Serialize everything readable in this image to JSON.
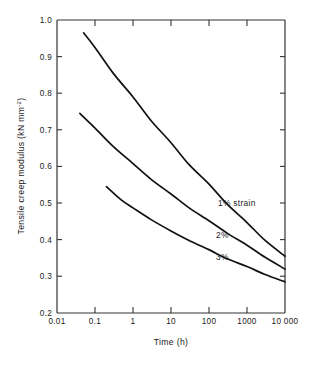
{
  "chart_data": {
    "type": "line",
    "title": "",
    "xlabel": "Time (h)",
    "ylabel": "Tensile creep modulus (kN mm⁻²)",
    "ylabel_parts": {
      "main": "Tensile creep modulus (kN mm",
      "exponent": "-2",
      "tail": ")"
    },
    "xscale": "log",
    "yscale": "linear",
    "xlim": [
      0.01,
      10000
    ],
    "ylim": [
      0.2,
      1.0
    ],
    "grid": false,
    "legend_position": "inline-annotations",
    "xticks": [
      0.01,
      0.1,
      1,
      10,
      100,
      1000,
      10000
    ],
    "xticklabels": [
      "0.01",
      "0.1",
      "1",
      "10",
      "100",
      "1000",
      "10 000"
    ],
    "yticks": [
      0.2,
      0.3,
      0.4,
      0.5,
      0.6,
      0.7,
      0.8,
      0.9,
      1.0
    ],
    "yticklabels": [
      "0.2",
      "0.3",
      "0.4",
      "0.5",
      "0.6",
      "0.7",
      "0.8",
      "0.9",
      "1.0"
    ],
    "series": [
      {
        "name": "1% strain",
        "label": "1% strain",
        "x": [
          0.05,
          0.1,
          0.3,
          1,
          3,
          10,
          30,
          100,
          300,
          1000,
          3000,
          10000
        ],
        "values": [
          0.965,
          0.925,
          0.855,
          0.79,
          0.725,
          0.665,
          0.605,
          0.552,
          0.497,
          0.447,
          0.398,
          0.355
        ]
      },
      {
        "name": "2%",
        "label": "2%",
        "x": [
          0.04,
          0.1,
          0.3,
          1,
          3,
          10,
          30,
          100,
          300,
          1000,
          3000,
          10000
        ],
        "values": [
          0.745,
          0.705,
          0.655,
          0.608,
          0.565,
          0.525,
          0.487,
          0.452,
          0.418,
          0.385,
          0.352,
          0.32
        ]
      },
      {
        "name": "3%",
        "label": "3%",
        "x": [
          0.2,
          0.5,
          1,
          3,
          10,
          30,
          100,
          300,
          1000,
          3000,
          10000
        ],
        "values": [
          0.545,
          0.508,
          0.487,
          0.455,
          0.424,
          0.398,
          0.373,
          0.348,
          0.327,
          0.305,
          0.285
        ]
      }
    ],
    "annotations": [
      {
        "text": "1% strain",
        "x": 300,
        "y": 0.5
      },
      {
        "text": "2%",
        "x": 300,
        "y": 0.41
      },
      {
        "text": "3%",
        "x": 300,
        "y": 0.355
      }
    ],
    "colors": {
      "curve": "#111111",
      "axis": "#333333",
      "background": "#ffffff",
      "text": "#1a1a1a"
    }
  }
}
